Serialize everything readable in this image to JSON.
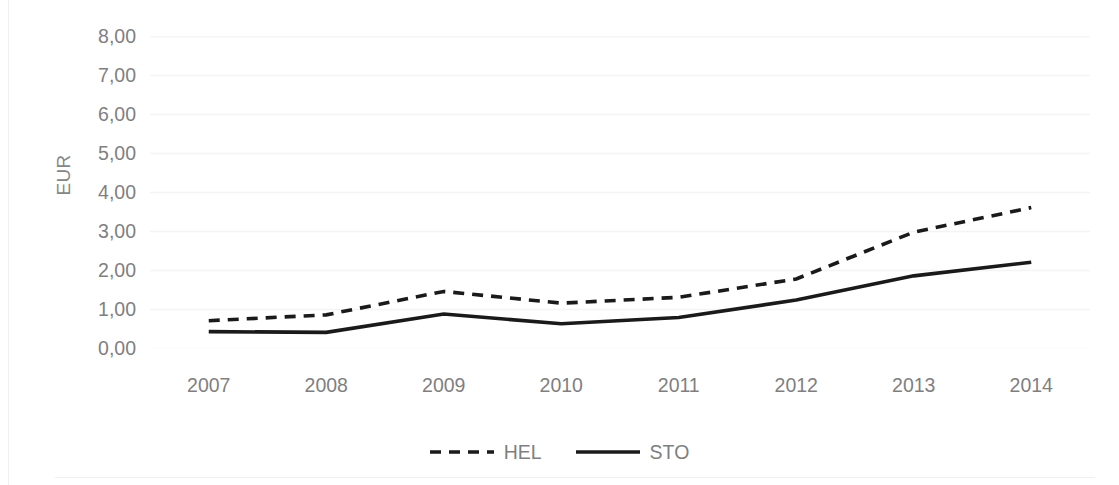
{
  "chart_data": {
    "type": "line",
    "title": "",
    "xlabel": "",
    "ylabel": "EUR",
    "categories": [
      "2007",
      "2008",
      "2009",
      "2010",
      "2011",
      "2012",
      "2013",
      "2014"
    ],
    "series": [
      {
        "name": "HEL",
        "style": "dashed",
        "color": "#1a1a1a",
        "values": [
          0.7,
          0.85,
          1.45,
          1.15,
          1.3,
          1.77,
          2.97,
          3.6
        ]
      },
      {
        "name": "STO",
        "style": "solid",
        "color": "#1a1a1a",
        "values": [
          0.42,
          0.4,
          0.87,
          0.62,
          0.78,
          1.23,
          1.85,
          2.2
        ]
      }
    ],
    "ylim": [
      0,
      8
    ],
    "ytick_values": [
      8,
      7,
      6,
      5,
      4,
      3,
      2,
      1,
      0
    ],
    "ytick_labels": [
      "8,00",
      "7,00",
      "6,00",
      "5,00",
      "4,00",
      "3,00",
      "2,00",
      "1,00",
      "0,00"
    ],
    "grid": true,
    "grid_color": "#f4f4f4",
    "legend_position": "bottom",
    "axis_text_color": "#7f7f7f",
    "background_color": "#ffffff"
  }
}
